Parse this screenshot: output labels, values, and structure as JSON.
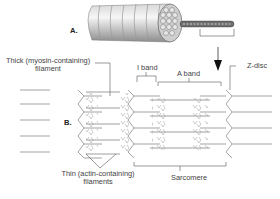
{
  "diagram": {
    "panel_a": {
      "label": "A."
    },
    "panel_b": {
      "label": "B."
    },
    "labels": {
      "thick_line1": "Thick (myosin-containing)",
      "thick_line2": "filament",
      "i_band": "I band",
      "a_band": "A band",
      "z_disc": "Z-disc",
      "thin_line1": "Thin (actin-containing)",
      "thin_line2": "filaments",
      "sarcomere": "Sarcomere"
    },
    "colors": {
      "line": "#555555",
      "filament": "#9a9a9a",
      "arrow": "#111111"
    }
  }
}
